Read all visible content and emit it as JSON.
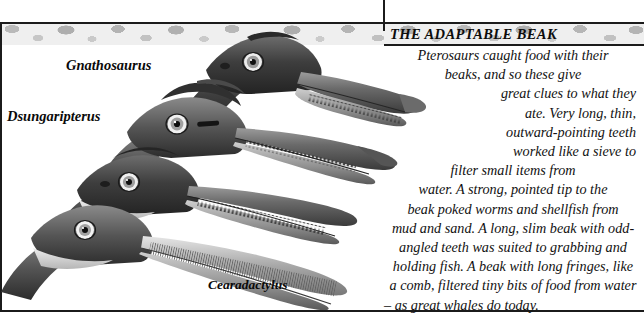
{
  "page": {
    "title": "THE ADAPTABLE BEAK",
    "width": 644,
    "height": 323,
    "palette": {
      "ink": "#111111",
      "frame": "#1b1b1b",
      "paper": "#ffffff",
      "texture_light": "#efefef",
      "texture_mid": "#bdbdbd",
      "texture_dark": "#9a9a9a"
    }
  },
  "species_labels": [
    {
      "id": "gnathosaurus",
      "name": "Gnathosaurus"
    },
    {
      "id": "dsungaripterus",
      "name": "Dsungaripterus"
    },
    {
      "id": "cearadactylus",
      "name": "Cearadactylus"
    },
    {
      "id": "pterodaustro",
      "name": "Pterodaustro"
    }
  ],
  "body": {
    "full_text": "Pterosaurs caught food with their beaks, and so these give great clues to what they ate. Very long, thin, outward-pointing teeth worked like a sieve to filter small items from water. A strong, pointed tip to the beak poked worms and shellfish from mud and sand. A long, slim beak with odd-angled teeth was suited to grabbing and holding fish. A beak with long fringes, like a comb, filtered tiny bits of food from water – as great whales do today.",
    "lines": [
      "Pterosaurs caught food with their",
      "beaks, and so these give",
      "great clues to what they",
      "ate. Very long, thin,",
      "outward-pointing teeth",
      "worked like a sieve to",
      "filter small items from",
      "water. A strong, pointed tip to the",
      "beak poked worms and shellfish from",
      "mud and sand. A long, slim beak with odd-",
      "angled teeth was suited to grabbing and",
      "holding fish. A beak with long fringes, like",
      "a comb, filtered tiny bits of food from water",
      "– as great whales do today."
    ]
  },
  "figures": [
    {
      "id": "gnathosaurus-head",
      "caption": "Gnathosaurus",
      "description": "pterosaur head with long spoon-tipped beak and fine comb teeth"
    },
    {
      "id": "dsungaripterus-head",
      "caption": "Dsungaripterus",
      "description": "pterosaur head with upturned pointed toothless beak tip and head crest"
    },
    {
      "id": "cearadactylus-head",
      "caption": "Cearadactylus",
      "description": "pterosaur head with long slim beak and odd-angled grabbing teeth"
    },
    {
      "id": "pterodaustro-head",
      "caption": "Pterodaustro",
      "description": "pterosaur head with upcurved beak bearing dense bristle-like filter fringes"
    }
  ]
}
